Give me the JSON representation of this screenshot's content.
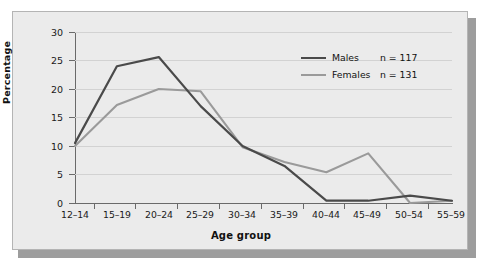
{
  "chart_data": {
    "type": "line",
    "title": "",
    "xlabel": "Age group",
    "ylabel": "Percentage",
    "categories": [
      "12–14",
      "15–19",
      "20–24",
      "25–29",
      "30–34",
      "35–39",
      "40–44",
      "45–49",
      "50–54",
      "55–59"
    ],
    "ylim": [
      0,
      30
    ],
    "yticks": [
      0,
      5,
      10,
      15,
      20,
      25,
      30
    ],
    "ytick_labels": [
      "0",
      "5",
      "10",
      "15",
      "20",
      "25",
      "30"
    ],
    "grid": true,
    "grid_axis": "y",
    "legend_position": "top-right",
    "series": [
      {
        "name": "Males",
        "n_label": "n = 117",
        "color": "#4a4a4a",
        "values": [
          10.5,
          24.0,
          25.6,
          17.0,
          10.0,
          6.5,
          0.4,
          0.4,
          1.3,
          0.4
        ]
      },
      {
        "name": "Females",
        "n_label": "n = 131",
        "color": "#9a9a9a",
        "values": [
          10.0,
          17.2,
          20.0,
          19.6,
          9.8,
          7.2,
          5.4,
          8.7,
          0.0,
          0.4
        ]
      }
    ]
  },
  "colors": {
    "panel_background": "#ebebeb",
    "panel_border": "#b4b4b4",
    "shadow": "#9d9d9d",
    "grid": "#d2d2d2",
    "axis": "#6a6a6a",
    "text": "#111111",
    "males_line": "#4a4a4a",
    "females_line": "#9a9a9a"
  }
}
